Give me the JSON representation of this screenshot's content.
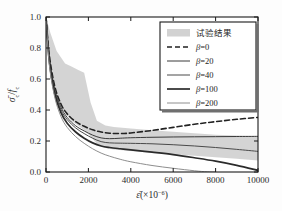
{
  "chart_data": {
    "type": "line",
    "title": "",
    "xlabel": "ε̄(×10⁻⁶)",
    "ylabel": "σ̄c/fc",
    "xlim": [
      0,
      10000
    ],
    "ylim": [
      0.0,
      1.0
    ],
    "xticks": [
      0,
      2000,
      4000,
      6000,
      8000,
      10000
    ],
    "xtick_labels": [
      "0",
      "2000",
      "4000",
      "6000",
      "8000",
      "10000"
    ],
    "yticks": [
      0.0,
      0.2,
      0.4,
      0.6,
      0.8,
      1.0
    ],
    "ytick_labels": [
      "0.0",
      "0.2",
      "0.4",
      "0.6",
      "0.8",
      "1.0"
    ],
    "grid": false,
    "legend_position": "top-right",
    "band": {
      "name": "试验结果",
      "color": "#d2d2d2",
      "x": [
        0,
        200,
        500,
        900,
        1200,
        1500,
        1800,
        2100,
        2400,
        2800,
        3200,
        4000,
        5000,
        6000,
        7000,
        8000,
        9000,
        10000
      ],
      "upper": [
        1.0,
        0.9,
        0.78,
        0.7,
        0.68,
        0.66,
        0.64,
        0.45,
        0.33,
        0.3,
        0.29,
        0.28,
        0.27,
        0.26,
        0.25,
        0.24,
        0.235,
        0.23
      ],
      "lower": [
        1.0,
        0.62,
        0.47,
        0.38,
        0.33,
        0.3,
        0.27,
        0.23,
        0.18,
        0.155,
        0.145,
        0.135,
        0.125,
        0.115,
        0.105,
        0.095,
        0.085,
        0.075
      ]
    },
    "series": [
      {
        "name": "β=0",
        "beta": 0,
        "style": "dashed",
        "color": "#222222",
        "width": 1.6,
        "x": [
          0,
          150,
          400,
          700,
          1000,
          1400,
          1800,
          2200,
          2600,
          3000,
          3500,
          4000,
          5000,
          6000,
          7000,
          8000,
          9000,
          10000
        ],
        "y": [
          1.0,
          0.76,
          0.56,
          0.44,
          0.375,
          0.325,
          0.295,
          0.272,
          0.258,
          0.25,
          0.248,
          0.252,
          0.268,
          0.288,
          0.308,
          0.325,
          0.34,
          0.352
        ]
      },
      {
        "name": "β=20",
        "beta": 20,
        "style": "solid",
        "color": "#3a3a3a",
        "width": 1.0,
        "x": [
          0,
          150,
          400,
          700,
          1000,
          1400,
          1800,
          2200,
          2600,
          3000,
          3500,
          4000,
          5000,
          6000,
          7000,
          8000,
          9000,
          10000
        ],
        "y": [
          1.0,
          0.74,
          0.54,
          0.42,
          0.352,
          0.298,
          0.265,
          0.238,
          0.22,
          0.215,
          0.218,
          0.221,
          0.224,
          0.226,
          0.227,
          0.228,
          0.229,
          0.23
        ]
      },
      {
        "name": "β=40",
        "beta": 40,
        "style": "solid",
        "color": "#4a4a4a",
        "width": 1.0,
        "x": [
          0,
          150,
          400,
          700,
          1000,
          1400,
          1800,
          2200,
          2600,
          3000,
          3500,
          4000,
          5000,
          6000,
          7000,
          8000,
          9000,
          10000
        ],
        "y": [
          1.0,
          0.73,
          0.53,
          0.405,
          0.338,
          0.284,
          0.248,
          0.218,
          0.196,
          0.188,
          0.186,
          0.185,
          0.182,
          0.176,
          0.168,
          0.158,
          0.146,
          0.133
        ]
      },
      {
        "name": "β=100",
        "beta": 100,
        "style": "solid",
        "color": "#2b2b2b",
        "width": 1.7,
        "x": [
          0,
          150,
          400,
          700,
          1000,
          1400,
          1800,
          2200,
          2600,
          3000,
          3500,
          4000,
          5000,
          6000,
          7000,
          8000,
          9000,
          10000
        ],
        "y": [
          1.0,
          0.72,
          0.51,
          0.385,
          0.315,
          0.258,
          0.218,
          0.188,
          0.168,
          0.158,
          0.15,
          0.143,
          0.128,
          0.112,
          0.092,
          0.07,
          0.043,
          0.01
        ]
      },
      {
        "name": "β=200",
        "beta": 200,
        "style": "solid",
        "color": "#8e8e8e",
        "width": 1.0,
        "x": [
          0,
          150,
          400,
          700,
          1000,
          1400,
          1800,
          2200,
          2600,
          3000,
          3500,
          4000,
          5000,
          6000,
          7000,
          7600,
          8000
        ],
        "y": [
          1.0,
          0.7,
          0.49,
          0.36,
          0.288,
          0.228,
          0.185,
          0.15,
          0.122,
          0.102,
          0.082,
          0.066,
          0.042,
          0.024,
          0.008,
          0.001,
          0.0
        ]
      }
    ],
    "legend_entries": [
      {
        "label": "试验结果",
        "marker": "band",
        "color": "#d2d2d2",
        "lang": "cn"
      },
      {
        "label": "β=0",
        "marker": "dashed",
        "color": "#222222",
        "lang": "en"
      },
      {
        "label": "β=20",
        "marker": "solid",
        "color": "#3a3a3a",
        "lang": "en"
      },
      {
        "label": "β=40",
        "marker": "solid",
        "color": "#4a4a4a",
        "lang": "en"
      },
      {
        "label": "β=100",
        "marker": "solid",
        "color": "#2b2b2b",
        "lang": "en"
      },
      {
        "label": "β=200",
        "marker": "solid",
        "color": "#8e8e8e",
        "lang": "en"
      }
    ]
  }
}
